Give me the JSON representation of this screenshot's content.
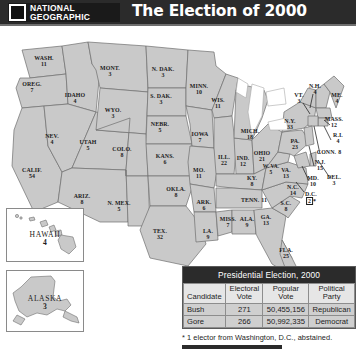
{
  "header": {
    "logo_line1": "NATIONAL",
    "logo_line2": "GEOGRAPHIC",
    "logo_icon": "national-geographic-rectangle-logo",
    "title": "The Election of 2000"
  },
  "map": {
    "title": "united-states-electoral-vote-map-2000",
    "states": [
      {
        "abbr": "WASH.",
        "votes": "11",
        "x": 44,
        "y": 35,
        "size": "sm"
      },
      {
        "abbr": "OREG.",
        "votes": "7",
        "x": 32,
        "y": 61,
        "size": "sm"
      },
      {
        "abbr": "CALIF.",
        "votes": "54",
        "x": 32,
        "y": 147,
        "size": "sm"
      },
      {
        "abbr": "IDAHO",
        "votes": "4",
        "x": 75,
        "y": 72,
        "size": "sm"
      },
      {
        "abbr": "NEV.",
        "votes": "4",
        "x": 52,
        "y": 113,
        "size": "sm"
      },
      {
        "abbr": "UTAH",
        "votes": "5",
        "x": 88,
        "y": 119,
        "size": "sm"
      },
      {
        "abbr": "ARIZ.",
        "votes": "8",
        "x": 82,
        "y": 173,
        "size": "sm"
      },
      {
        "abbr": "MONT.",
        "votes": "3",
        "x": 110,
        "y": 45,
        "size": "sm"
      },
      {
        "abbr": "WYO.",
        "votes": "3",
        "x": 113,
        "y": 87,
        "size": "sm"
      },
      {
        "abbr": "COLO.",
        "votes": "8",
        "x": 122,
        "y": 126,
        "size": "sm"
      },
      {
        "abbr": "N. MEX.",
        "votes": "5",
        "x": 119,
        "y": 180,
        "size": "sm"
      },
      {
        "abbr": "N. DAK.",
        "votes": "3",
        "x": 163,
        "y": 46,
        "size": "sm"
      },
      {
        "abbr": "S. DAK.",
        "votes": "3",
        "x": 161,
        "y": 73,
        "size": "sm"
      },
      {
        "abbr": "NEBR.",
        "votes": "5",
        "x": 160,
        "y": 101,
        "size": "sm"
      },
      {
        "abbr": "KANS.",
        "votes": "6",
        "x": 165,
        "y": 133,
        "size": "sm"
      },
      {
        "abbr": "OKLA.",
        "votes": "8",
        "x": 176,
        "y": 166,
        "size": "sm"
      },
      {
        "abbr": "TEX.",
        "votes": "32",
        "x": 160,
        "y": 208,
        "size": "sm"
      },
      {
        "abbr": "MINN.",
        "votes": "10",
        "x": 199,
        "y": 63,
        "size": "sm"
      },
      {
        "abbr": "IOWA",
        "votes": "7",
        "x": 200,
        "y": 111,
        "size": "sm"
      },
      {
        "abbr": "MO.",
        "votes": "11",
        "x": 199,
        "y": 147,
        "size": "sm"
      },
      {
        "abbr": "ARK.",
        "votes": "6",
        "x": 204,
        "y": 179,
        "size": "sm"
      },
      {
        "abbr": "LA.",
        "votes": "9",
        "x": 208,
        "y": 208,
        "size": "sm"
      },
      {
        "abbr": "WIS.",
        "votes": "11",
        "x": 218,
        "y": 77,
        "size": "sm"
      },
      {
        "abbr": "ILL.",
        "votes": "22",
        "x": 224,
        "y": 134,
        "size": "sm"
      },
      {
        "abbr": "MICH.",
        "votes": "18",
        "x": 250,
        "y": 108,
        "size": "sm"
      },
      {
        "abbr": "IND.",
        "votes": "12",
        "x": 243,
        "y": 135,
        "size": "sm"
      },
      {
        "abbr": "OHIO",
        "votes": "21",
        "x": 262,
        "y": 130,
        "size": "sm"
      },
      {
        "abbr": "KY.",
        "votes": "8",
        "x": 252,
        "y": 155,
        "size": "sm"
      },
      {
        "abbr": "MISS.",
        "votes": "7",
        "x": 228,
        "y": 196,
        "size": "sm"
      },
      {
        "abbr": "ALA.",
        "votes": "9",
        "x": 247,
        "y": 196,
        "size": "sm"
      },
      {
        "abbr": "TENN.",
        "votes": "11",
        "x": 254,
        "y": 174,
        "size": "sm",
        "inline": true
      },
      {
        "abbr": "GA.",
        "votes": "13",
        "x": 266,
        "y": 194,
        "size": "sm"
      },
      {
        "abbr": "FLA.",
        "votes": "25",
        "x": 286,
        "y": 227,
        "size": "sm"
      },
      {
        "abbr": "S.C.",
        "votes": "8",
        "x": 286,
        "y": 180,
        "size": "sm"
      },
      {
        "abbr": "N.C.",
        "votes": "14",
        "x": 293,
        "y": 164,
        "size": "sm"
      },
      {
        "abbr": "VA.",
        "votes": "13",
        "x": 286,
        "y": 147,
        "size": "sm"
      },
      {
        "abbr": "W. VA.",
        "votes": "5",
        "x": 271,
        "y": 144,
        "size": "tiny"
      },
      {
        "abbr": "PA.",
        "votes": "23",
        "x": 295,
        "y": 118,
        "size": "sm"
      },
      {
        "abbr": "N.Y.",
        "votes": "33",
        "x": 290,
        "y": 98,
        "size": "sm"
      },
      {
        "abbr": "VT.",
        "votes": "3",
        "x": 299,
        "y": 72,
        "size": "sm"
      },
      {
        "abbr": "N.H.",
        "votes": "4",
        "x": 315,
        "y": 63,
        "size": "sm"
      },
      {
        "abbr": "ME.",
        "votes": "4",
        "x": 337,
        "y": 72,
        "size": "sm"
      },
      {
        "abbr": "MASS.",
        "votes": "12",
        "x": 334,
        "y": 96,
        "size": "sm"
      },
      {
        "abbr": "R.I.",
        "votes": "4",
        "x": 338,
        "y": 112,
        "size": "sm"
      },
      {
        "abbr": "CONN.",
        "votes": "8",
        "x": 329,
        "y": 126,
        "size": "sm",
        "inline": true
      },
      {
        "abbr": "N.J.",
        "votes": "15",
        "x": 320,
        "y": 139,
        "size": "sm"
      },
      {
        "abbr": "MD.",
        "votes": "10",
        "x": 313,
        "y": 155,
        "size": "sm"
      },
      {
        "abbr": "DEL.",
        "votes": "3",
        "x": 334,
        "y": 154,
        "size": "sm"
      }
    ],
    "dc": {
      "abbr": "D.C.",
      "votes": "2",
      "footnote_marker": "*"
    },
    "insets": [
      {
        "name": "HAWAII",
        "votes": "4"
      },
      {
        "name": "ALASKA",
        "votes": "3"
      }
    ]
  },
  "table": {
    "title": "Presidential Election, 2000",
    "columns": [
      "Candidate",
      "Electoral Vote",
      "Popular Vote",
      "Political Party"
    ],
    "columns_display": [
      {
        "l1": "Candidate",
        "l2": ""
      },
      {
        "l1": "Electoral",
        "l2": "Vote"
      },
      {
        "l1": "Popular",
        "l2": "Vote"
      },
      {
        "l1": "Political",
        "l2": "Party"
      }
    ],
    "rows": [
      {
        "candidate": "Bush",
        "electoral_vote": "271",
        "popular_vote": "50,455,156",
        "party": "Republican"
      },
      {
        "candidate": "Gore",
        "electoral_vote": "266",
        "popular_vote": "50,992,335",
        "party": "Democrat"
      }
    ],
    "footnote": "* 1 elector from Washington, D.C., abstained."
  },
  "chart_data": {
    "type": "map",
    "title": "The Election of 2000",
    "subtitle": "Presidential Election, 2000",
    "unit": "electoral votes",
    "total_electoral_votes": 538,
    "categories": [
      "ALA.",
      "ALASKA",
      "ARIZ.",
      "ARK.",
      "CALIF.",
      "COLO.",
      "CONN.",
      "DEL.",
      "D.C.",
      "FLA.",
      "GA.",
      "HAWAII",
      "IDAHO",
      "ILL.",
      "IND.",
      "IOWA",
      "KANS.",
      "KY.",
      "LA.",
      "ME.",
      "MD.",
      "MASS.",
      "MICH.",
      "MINN.",
      "MISS.",
      "MO.",
      "MONT.",
      "NEBR.",
      "NEV.",
      "N.H.",
      "N.J.",
      "N. MEX.",
      "N.Y.",
      "N.C.",
      "N. DAK.",
      "OHIO",
      "OKLA.",
      "OREG.",
      "PA.",
      "R.I.",
      "S.C.",
      "S. DAK.",
      "TENN.",
      "TEX.",
      "UTAH",
      "VT.",
      "VA.",
      "WASH.",
      "W. VA.",
      "WIS.",
      "WYO."
    ],
    "values": [
      9,
      3,
      8,
      6,
      54,
      8,
      8,
      3,
      2,
      25,
      13,
      4,
      4,
      22,
      12,
      7,
      6,
      8,
      9,
      4,
      10,
      12,
      18,
      10,
      7,
      11,
      3,
      5,
      4,
      4,
      15,
      5,
      33,
      14,
      3,
      21,
      8,
      7,
      23,
      4,
      8,
      3,
      11,
      32,
      5,
      3,
      13,
      11,
      5,
      11,
      3
    ],
    "xlabel": "State",
    "ylabel": "Electoral Votes",
    "annotations": [
      "* 1 elector from Washington, D.C., abstained.",
      "Bush 271 electoral votes, 50,455,156 popular votes, Republican",
      "Gore 266 electoral votes, 50,992,335 popular votes, Democrat"
    ],
    "legend": [
      "Electoral Vote",
      "Popular Vote",
      "Political Party"
    ],
    "grid": false
  },
  "colors": {
    "header_bg": "#2b2b2b",
    "header_text": "#ffffff",
    "state_fill": "#c9c9c9",
    "state_stroke": "#6f6f6f",
    "table_header_bg": "#e6e6e6",
    "table_cell_bg": "#cfcfcf",
    "background": "#ffffff"
  }
}
